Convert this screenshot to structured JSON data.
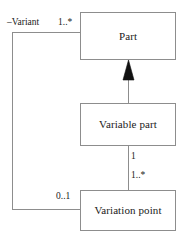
{
  "diagram": {
    "type": "uml-class-diagram",
    "background_color": "#ffffff",
    "line_color": "#8d8d8d",
    "arrow_color": "#111111",
    "text_color": "#1a1a1a",
    "classes": [
      {
        "id": "part",
        "name": "Part"
      },
      {
        "id": "variable_part",
        "name": "Variable part"
      },
      {
        "id": "variation_point",
        "name": "Variation point"
      }
    ],
    "relationships": [
      {
        "id": "generalization",
        "kind": "generalization",
        "from": "Variable part",
        "to": "Part",
        "arrowhead": "filled-triangle"
      },
      {
        "id": "variable-to-variation",
        "kind": "association",
        "from": "Variable part",
        "to": "Variation point",
        "source_multiplicity": "1",
        "target_multiplicity": "1..*"
      },
      {
        "id": "variation-to-part",
        "kind": "association",
        "from": "Variation point",
        "to": "Part",
        "source_multiplicity": "0..1",
        "target_multiplicity": "1..*",
        "target_role": "–Variant"
      }
    ],
    "labels": {
      "variant_role": "–Variant",
      "variant_multiplicity": "1..*",
      "variable_part_end": "1",
      "variation_point_end": "1..*",
      "variation_point_assoc_end": "0..1"
    }
  }
}
